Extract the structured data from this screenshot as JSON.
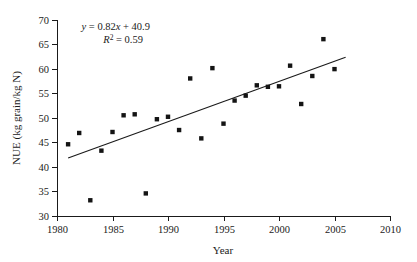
{
  "chart_data": {
    "type": "scatter",
    "title": "",
    "xlabel": "Year",
    "ylabel": "NUE (kg grain/kg N)",
    "xlim": [
      1980,
      2010
    ],
    "ylim": [
      30,
      70
    ],
    "xticks": [
      1980,
      1985,
      1990,
      1995,
      2000,
      2005,
      2010
    ],
    "yticks": [
      30,
      35,
      40,
      45,
      50,
      55,
      60,
      65,
      70
    ],
    "xtick_labels": [
      "1980",
      "1985",
      "1990",
      "1995",
      "2000",
      "2005",
      "2010"
    ],
    "ytick_labels": [
      "30",
      "35",
      "40",
      "45",
      "50",
      "55",
      "60",
      "65",
      "70"
    ],
    "grid": false,
    "legend": false,
    "marker_style": "filled-square",
    "marker_color": "#141414",
    "series": [
      {
        "name": "NUE",
        "x": [
          1981,
          1982,
          1983,
          1984,
          1985,
          1986,
          1987,
          1988,
          1989,
          1990,
          1991,
          1992,
          1993,
          1994,
          1995,
          1996,
          1997,
          1998,
          1999,
          2000,
          2001,
          2002,
          2003,
          2004,
          2005
        ],
        "y": [
          44.6,
          46.9,
          33.2,
          43.3,
          47.1,
          50.5,
          50.7,
          34.6,
          49.7,
          50.2,
          47.5,
          58.0,
          45.8,
          60.1,
          48.8,
          53.5,
          54.5,
          56.6,
          56.3,
          56.4,
          60.6,
          52.8,
          58.5,
          66.0,
          59.9
        ]
      }
    ],
    "trendline": {
      "equation": "y = 0.82x + 40.9",
      "equation_y": "y",
      "equation_rest": " = 0.82",
      "equation_x": "x",
      "equation_tail": " + 40.9",
      "r2_symbol": "R",
      "r2_exponent": "2",
      "r2_value": " = 0.59",
      "slope": 0.82,
      "intercept": 40.9,
      "r_squared": 0.59,
      "x_start": 1981,
      "x_end": 2006,
      "y_start": 41.8,
      "y_end": 62.3
    },
    "annotations": [
      {
        "text": "y = 0.82x + 40.9"
      },
      {
        "text": "R2 = 0.59"
      }
    ]
  }
}
